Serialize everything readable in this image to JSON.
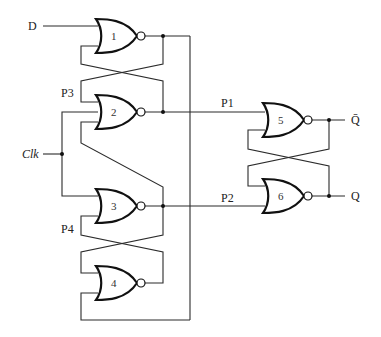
{
  "diagram": {
    "type": "circuit",
    "inputs": {
      "d": "D",
      "clk": "Clk"
    },
    "outputs": {
      "qbar": "Q̄",
      "q": "Q"
    },
    "nodes": {
      "p1": "P1",
      "p2": "P2",
      "p3": "P3",
      "p4": "P4"
    },
    "gates": [
      {
        "id": "1",
        "label": "1",
        "type": "NOR"
      },
      {
        "id": "2",
        "label": "2",
        "type": "NOR"
      },
      {
        "id": "3",
        "label": "3",
        "type": "NOR"
      },
      {
        "id": "4",
        "label": "4",
        "type": "NOR"
      },
      {
        "id": "5",
        "label": "5",
        "type": "NOR"
      },
      {
        "id": "6",
        "label": "6",
        "type": "NOR"
      }
    ]
  }
}
